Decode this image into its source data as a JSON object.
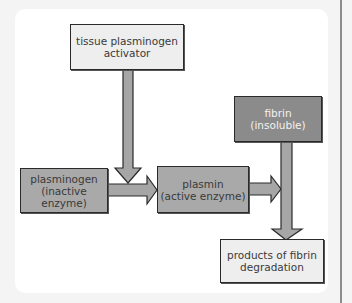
{
  "diagram": {
    "title": "",
    "nodes": {
      "tpa": {
        "line1": "tissue plasminogen",
        "line2": "activator"
      },
      "fibrin": {
        "line1": "fibrin",
        "line2": "(insoluble)"
      },
      "plasminogen": {
        "line1": "plasminogen",
        "line2": "(inactive enzyme)"
      },
      "plasmin": {
        "line1": "plasmin",
        "line2": "(active enzyme)"
      },
      "products": {
        "line1": "products of fibrin",
        "line2": "degradation"
      }
    },
    "edges": [
      {
        "from": "tissue plasminogen activator",
        "to": "plasminogen→plasmin conversion"
      },
      {
        "from": "plasminogen (inactive enzyme)",
        "to": "plasmin (active enzyme)"
      },
      {
        "from": "plasmin (active enzyme)",
        "to": "fibrin→products conversion"
      },
      {
        "from": "fibrin (insoluble)",
        "to": "products of fibrin degradation"
      }
    ],
    "colors": {
      "light_box": "#eeeeee",
      "mid_box": "#a9a9a9",
      "dark_box": "#8b8b8b",
      "arrow_fill": "#a6a6a6",
      "border": "#2a2a2a"
    }
  }
}
